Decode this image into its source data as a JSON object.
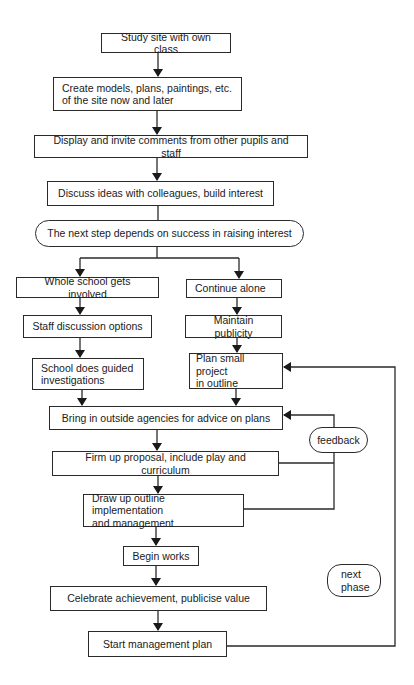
{
  "diagram": {
    "type": "flowchart",
    "nodes": {
      "study_site": "Study site with own class",
      "create_models": "Create models, plans, paintings, etc.\nof the site now and later",
      "display": "Display and invite comments from other pupils and staff",
      "discuss": "Discuss ideas with colleagues, build interest",
      "decision": "The next step depends on success in raising interest",
      "whole_school": "Whole school gets involved",
      "continue_alone": "Continue alone",
      "staff_discussion": "Staff discussion options",
      "maintain_publicity": "Maintain publicity",
      "guided_investigations": "School does guided\ninvestigations",
      "plan_small": "Plan small project\nin outline",
      "bring_in": "Bring in outside agencies for advice on plans",
      "feedback": "feedback",
      "firm_up": "Firm up proposal, include play and curriculum",
      "draw_up": "Draw up outline implementation\nand management",
      "begin_works": "Begin works",
      "next_phase": "next\nphase",
      "celebrate": "Celebrate achievement, publicise value",
      "start_management": "Start management plan"
    },
    "edges": [
      [
        "study_site",
        "create_models"
      ],
      [
        "create_models",
        "display"
      ],
      [
        "display",
        "discuss"
      ],
      [
        "discuss",
        "decision"
      ],
      [
        "decision",
        "whole_school"
      ],
      [
        "decision",
        "continue_alone"
      ],
      [
        "whole_school",
        "staff_discussion"
      ],
      [
        "staff_discussion",
        "guided_investigations"
      ],
      [
        "guided_investigations",
        "bring_in"
      ],
      [
        "continue_alone",
        "maintain_publicity"
      ],
      [
        "maintain_publicity",
        "plan_small"
      ],
      [
        "plan_small",
        "bring_in"
      ],
      [
        "bring_in",
        "firm_up"
      ],
      [
        "firm_up",
        "draw_up"
      ],
      [
        "firm_up",
        "bring_in",
        "feedback"
      ],
      [
        "draw_up",
        "bring_in",
        "feedback"
      ],
      [
        "draw_up",
        "begin_works"
      ],
      [
        "begin_works",
        "celebrate"
      ],
      [
        "celebrate",
        "start_management"
      ],
      [
        "start_management",
        "plan_small",
        "next phase"
      ]
    ]
  }
}
